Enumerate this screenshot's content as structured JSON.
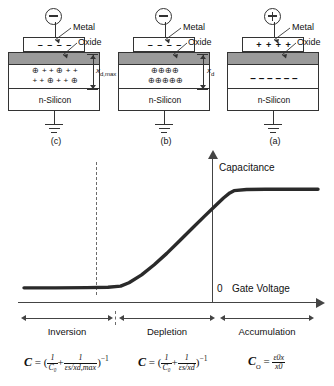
{
  "diagrams": [
    {
      "tag": "(c)",
      "state": "inversion",
      "terminal_sign": "minus",
      "metal_label": "Metal",
      "oxide_label": "Oxide",
      "substrate_label": "n-Silicon",
      "metal_charges": "– – – –",
      "depletion_label": "x",
      "depletion_sub": "d,max",
      "charge_row_1": [
        "⊕",
        "+",
        "+",
        "⊕",
        "+",
        "+"
      ],
      "charge_row_2": [
        "+",
        "+",
        "⊕",
        "+",
        "+",
        "⊕"
      ]
    },
    {
      "tag": "(b)",
      "state": "depletion",
      "terminal_sign": "minus",
      "metal_label": "Metal",
      "oxide_label": "Oxide",
      "substrate_label": "n-Silicon",
      "metal_charges": "– – – –",
      "depletion_label": "x",
      "depletion_sub": "d",
      "charge_row_1": [
        "⊕",
        "⊕",
        "⊕",
        "⊕"
      ],
      "charge_row_2": [
        "⊕",
        "⊕",
        "⊕",
        "⊕",
        "⊕"
      ]
    },
    {
      "tag": "(a)",
      "state": "accumulation",
      "terminal_sign": "plus",
      "metal_label": "Metal",
      "oxide_label": "Oxide",
      "substrate_label": "n-Silicon",
      "metal_charges": "+ + + +",
      "depletion_label": "",
      "depletion_sub": "",
      "charge_row_1": [],
      "charge_row_2": [],
      "electron_row": "–  –  –  –  –  –"
    }
  ],
  "chart_data": {
    "type": "line",
    "title": "",
    "xlabel": "Gate Voltage",
    "ylabel": "Capacitance",
    "origin_label": "0",
    "xlim": [
      -10,
      4
    ],
    "ylim": [
      0,
      1.15
    ],
    "grid": false,
    "legend": "none",
    "series": [
      {
        "name": "C-V characteristic",
        "x": [
          -10.0,
          -8.5,
          -7.0,
          -6.0,
          -5.4,
          -5.0,
          -4.4,
          -3.8,
          -3.2,
          -2.6,
          -2.0,
          -1.4,
          -0.9,
          -0.5,
          -0.2,
          0.0,
          0.6,
          1.5,
          2.6,
          4.0
        ],
        "y": [
          0.125,
          0.125,
          0.127,
          0.13,
          0.14,
          0.17,
          0.24,
          0.33,
          0.43,
          0.54,
          0.65,
          0.76,
          0.85,
          0.92,
          0.965,
          0.985,
          0.995,
          0.997,
          0.997,
          0.997
        ]
      }
    ],
    "annotations": [
      {
        "type": "vertical-dashed-line",
        "x": -5.3,
        "meaning": "threshold between inversion and depletion"
      },
      {
        "type": "vertical-axis-line",
        "x": 0.0,
        "meaning": "zero gate voltage"
      }
    ]
  },
  "regions": [
    {
      "name": "Inversion"
    },
    {
      "name": "Depletion"
    },
    {
      "name": "Accumulation"
    }
  ],
  "formulas": [
    {
      "id": "inversion-capacitance",
      "lhs": "C",
      "text": "C = (1/C₀ + 1/(εs/x_d,max))⁻¹",
      "parts": {
        "lhs": "C",
        "eq": "=",
        "open": "(",
        "f1_num": "1",
        "f1_den": "C₀",
        "plus": "+",
        "f2_num": "1",
        "f2_den": "εs/xd,max",
        "close": ")",
        "exp": "−1"
      }
    },
    {
      "id": "depletion-capacitance",
      "lhs": "C",
      "text": "C = (1/C₀ + 1/(εs/x_d))⁻¹",
      "parts": {
        "lhs": "C",
        "eq": "=",
        "open": "(",
        "f1_num": "1",
        "f1_den": "C₀",
        "plus": "+",
        "f2_num": "1",
        "f2_den": "εs/xd",
        "close": ")",
        "exp": "−1"
      }
    },
    {
      "id": "oxide-capacitance",
      "lhs": "C₀",
      "text": "C₀ = εox / x₀",
      "parts": {
        "lhs": "C",
        "lhs_sub": "O",
        "eq": "=",
        "num": "ε0x",
        "den": "x0"
      }
    }
  ]
}
